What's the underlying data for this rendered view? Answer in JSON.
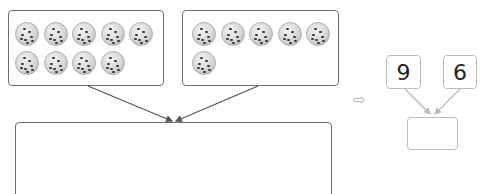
{
  "groups": [
    {
      "name": "left-group",
      "count": 9,
      "item": "cookie"
    },
    {
      "name": "right-group",
      "count": 6,
      "item": "cookie"
    }
  ],
  "combined_box": {
    "value": ""
  },
  "implies_arrow": "⇨",
  "number_bond": {
    "parts": [
      "9",
      "6"
    ],
    "whole": ""
  },
  "colors": {
    "box_border": "#6e6e6e",
    "bond_border": "#bdbdbd",
    "arrow": "#555555",
    "bond_arrow": "#bbbbbb"
  }
}
